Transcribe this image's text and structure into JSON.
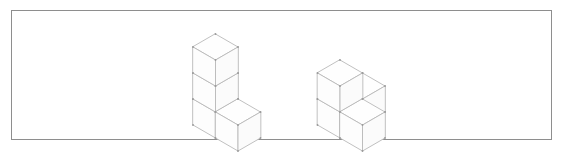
{
  "page": {
    "width": 564,
    "height": 155,
    "background_color": "#ffffff"
  },
  "frame": {
    "name": "content-border",
    "x": 11,
    "y": 10,
    "width": 541,
    "height": 130,
    "border_color": "#8e8e8e",
    "border_width": 1
  },
  "style": {
    "line_color": "#b9b9b9",
    "face_fill": "#ffffff",
    "vertex_dot_color": "#9a9a9a",
    "line_width": 0.9
  },
  "isometric": {
    "cube_edge_px": 26,
    "dx": 22.5,
    "dy": 13.0,
    "dz": 26.0,
    "note": "screen offset per unit: +x -> (+dx,+dy), +y -> (-dx,+dy), +z -> (0,-dz)"
  },
  "figures": [
    {
      "name": "left-structure",
      "label": "left block figure",
      "cube_count": 4,
      "origin": {
        "x": 215.5,
        "y": 112.0
      },
      "shape": "vertical column of three cubes with one cube attached at the front-right of the bottom level",
      "cubes": [
        {
          "id": "L1",
          "ix": 0,
          "iy": 0,
          "iz": 0
        },
        {
          "id": "L2",
          "ix": 0,
          "iy": 0,
          "iz": 1
        },
        {
          "id": "L3",
          "ix": 0,
          "iy": 0,
          "iz": 2
        },
        {
          "id": "L4",
          "ix": 1,
          "iy": 0,
          "iz": 0
        }
      ]
    },
    {
      "name": "right-structure",
      "label": "right block figure",
      "cube_count": 4,
      "origin": {
        "x": 340.0,
        "y": 112.0
      },
      "shape": "three cubes forming an L on the bottom level with one cube stacked on the back corner cube",
      "cubes": [
        {
          "id": "R1",
          "ix": 0,
          "iy": 0,
          "iz": 0
        },
        {
          "id": "R2",
          "ix": 1,
          "iy": 0,
          "iz": 0
        },
        {
          "id": "R3",
          "ix": 0,
          "iy": -1,
          "iz": 0
        },
        {
          "id": "R4",
          "ix": 0,
          "iy": 0,
          "iz": 1
        }
      ]
    }
  ]
}
